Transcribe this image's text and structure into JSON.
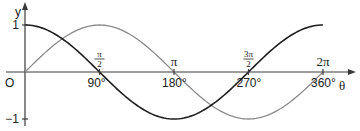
{
  "chart_data": {
    "type": "line",
    "title": "",
    "xlabel": "θ",
    "ylabel": "y",
    "origin_label": "O",
    "xlim": [
      0,
      360
    ],
    "ylim": [
      -1,
      1
    ],
    "grid": false,
    "legend": "none",
    "x_ticks_degrees": [
      {
        "value": 90,
        "label": "90°"
      },
      {
        "value": 180,
        "label": "180°"
      },
      {
        "value": 270,
        "label": "270°"
      },
      {
        "value": 360,
        "label": "360°"
      }
    ],
    "x_ticks_radians": [
      {
        "value": 90,
        "label": "π/2",
        "num": "π",
        "den": "2"
      },
      {
        "value": 180,
        "label": "π"
      },
      {
        "value": 270,
        "label": "3π/2",
        "num": "3π",
        "den": "2"
      },
      {
        "value": 360,
        "label": "2π"
      }
    ],
    "y_ticks": [
      {
        "value": 1,
        "label": "1"
      },
      {
        "value": -1,
        "label": "−1"
      }
    ],
    "series": [
      {
        "name": "sin θ",
        "color": "#8a8a8a",
        "function": "sin",
        "x": [
          0,
          90,
          180,
          270,
          360
        ],
        "values": [
          0,
          1,
          0,
          -1,
          0
        ]
      },
      {
        "name": "cos θ",
        "color": "#1e1e1e",
        "function": "cos",
        "x": [
          0,
          90,
          180,
          270,
          360
        ],
        "values": [
          1,
          0,
          -1,
          0,
          1
        ]
      }
    ]
  }
}
